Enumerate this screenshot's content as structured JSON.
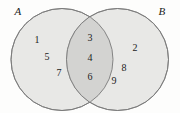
{
  "figure": {
    "type": "venn-diagram",
    "background_color": "#fdfdfc",
    "circle_fill": "#e8e8e6",
    "intersection_fill": "#d3d3d1",
    "stroke_color": "#7a7a7a",
    "text_color": "#222222"
  },
  "sets": {
    "left": {
      "label": "A",
      "cx": 62,
      "cy": 59.5,
      "r": 51
    },
    "right": {
      "label": "B",
      "cx": 117.5,
      "cy": 59.5,
      "r": 51
    }
  },
  "set_label_positions": {
    "left": {
      "x": 18,
      "y": 11
    },
    "right": {
      "x": 162,
      "y": 11
    }
  },
  "regions": {
    "left_only": {
      "name": "A only",
      "elements": [
        {
          "value": "1",
          "x": 37,
          "y": 40
        },
        {
          "value": "5",
          "x": 47,
          "y": 57
        },
        {
          "value": "7",
          "x": 59,
          "y": 73
        }
      ]
    },
    "intersection": {
      "name": "A and B",
      "elements": [
        {
          "value": "3",
          "x": 90,
          "y": 38
        },
        {
          "value": "4",
          "x": 90,
          "y": 58
        },
        {
          "value": "6",
          "x": 90,
          "y": 77
        }
      ]
    },
    "right_only": {
      "name": "B only",
      "elements": [
        {
          "value": "2",
          "x": 135,
          "y": 48
        },
        {
          "value": "8",
          "x": 124,
          "y": 68
        },
        {
          "value": "9",
          "x": 114,
          "y": 81
        }
      ]
    }
  }
}
